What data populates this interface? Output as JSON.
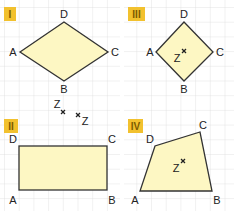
{
  "colors": {
    "grid": "#d9d9d9",
    "fill": "#fdf7c3",
    "stroke": "#333333",
    "badge": "#f2c12e",
    "badge_text": "#6b4e00"
  },
  "panels": [
    {
      "id": "I",
      "label": "I",
      "shape": "rhombus",
      "vertices": {
        "A": [
          20,
          52
        ],
        "B": [
          64,
          81
        ],
        "C": [
          108,
          52
        ],
        "D": [
          64,
          22
        ]
      },
      "labels": {
        "A": "A",
        "B": "B",
        "C": "C",
        "D": "D"
      }
    },
    {
      "id": "III",
      "label": "III",
      "shape": "square",
      "vertices": {
        "A": [
          156,
          52
        ],
        "B": [
          184,
          81
        ],
        "C": [
          213,
          52
        ],
        "D": [
          184,
          22
        ]
      },
      "labels": {
        "A": "A",
        "B": "B",
        "C": "C",
        "D": "D"
      },
      "center_mark": {
        "label": "Z",
        "pos": [
          184,
          51
        ]
      }
    },
    {
      "id": "II",
      "label": "II",
      "shape": "rectangle",
      "vertices": {
        "A": [
          19,
          190
        ],
        "B": [
          107,
          190
        ],
        "C": [
          107,
          146
        ],
        "D": [
          19,
          146
        ]
      },
      "labels": {
        "A": "A",
        "B": "B",
        "C": "C",
        "D": "D"
      },
      "marks": [
        {
          "label": "Z",
          "pos": [
            63,
            112
          ]
        },
        {
          "label": "Z",
          "pos": [
            78,
            115
          ]
        }
      ]
    },
    {
      "id": "IV",
      "label": "IV",
      "shape": "quadrilateral",
      "vertices": {
        "A": [
          140,
          191
        ],
        "B": [
          212,
          191
        ],
        "C": [
          200,
          132
        ],
        "D": [
          155,
          146
        ]
      },
      "labels": {
        "A": "A",
        "B": "B",
        "C": "C",
        "D": "D"
      },
      "center_mark": {
        "label": "Z",
        "pos": [
          183,
          161
        ]
      }
    }
  ],
  "text": {
    "p1": {
      "badge": "I",
      "A": "A",
      "B": "B",
      "C": "C",
      "D": "D"
    },
    "p2": {
      "badge": "II",
      "A": "A",
      "B": "B",
      "C": "C",
      "D": "D",
      "Z1": "Z",
      "Z2": "Z"
    },
    "p3": {
      "badge": "III",
      "A": "A",
      "B": "B",
      "C": "C",
      "D": "D",
      "Z": "Z"
    },
    "p4": {
      "badge": "IV",
      "A": "A",
      "B": "B",
      "C": "C",
      "D": "D",
      "Z": "Z"
    }
  }
}
